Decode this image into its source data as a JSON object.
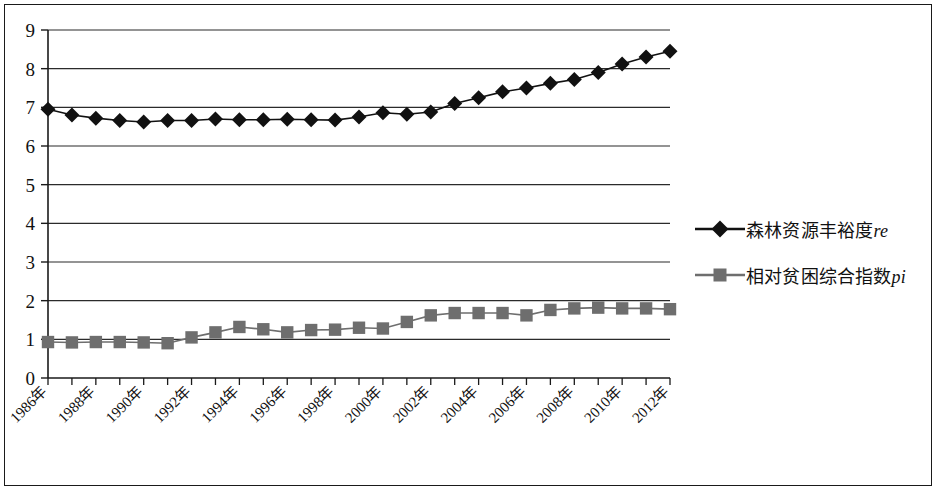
{
  "chart_data": {
    "type": "line",
    "title": "",
    "xlabel": "",
    "ylabel": "",
    "ylim": [
      0,
      9
    ],
    "ytick_step": 1,
    "yticks": [
      "0",
      "1",
      "2",
      "3",
      "4",
      "5",
      "6",
      "7",
      "8",
      "9"
    ],
    "grid": true,
    "grid_axis": "y",
    "legend_position": "right",
    "x": [
      1986,
      1987,
      1988,
      1989,
      1990,
      1991,
      1992,
      1993,
      1994,
      1995,
      1996,
      1997,
      1998,
      1999,
      2000,
      2001,
      2002,
      2003,
      2004,
      2005,
      2006,
      2007,
      2008,
      2009,
      2010,
      2011,
      2012
    ],
    "categories": [
      "1986年",
      "1987年",
      "1988年",
      "1989年",
      "1990年",
      "1991年",
      "1992年",
      "1993年",
      "1994年",
      "1995年",
      "1996年",
      "1997年",
      "1998年",
      "1999年",
      "2000年",
      "2001年",
      "2002年",
      "2003年",
      "2004年",
      "2005年",
      "2006年",
      "2007年",
      "2008年",
      "2009年",
      "2010年",
      "2011年",
      "2012年"
    ],
    "xtick_labels_shown": [
      "1986年",
      "1988年",
      "1990年",
      "1992年",
      "1994年",
      "1996年",
      "1998年",
      "2000年",
      "2002年",
      "2004年",
      "2006年",
      "2008年",
      "2010年",
      "2012年"
    ],
    "series": [
      {
        "name": "森林资源丰裕度re",
        "marker": "diamond",
        "color": "#111111",
        "values": [
          6.95,
          6.8,
          6.72,
          6.66,
          6.62,
          6.66,
          6.66,
          6.7,
          6.68,
          6.68,
          6.69,
          6.68,
          6.67,
          6.75,
          6.86,
          6.82,
          6.88,
          7.1,
          7.25,
          7.4,
          7.5,
          7.62,
          7.72,
          7.9,
          8.12,
          8.3,
          8.45
        ]
      },
      {
        "name": "相对贫困综合指数pi",
        "marker": "square",
        "color": "#6e6e6e",
        "values": [
          0.93,
          0.92,
          0.93,
          0.93,
          0.92,
          0.9,
          1.05,
          1.18,
          1.32,
          1.26,
          1.18,
          1.24,
          1.25,
          1.3,
          1.28,
          1.45,
          1.62,
          1.68,
          1.68,
          1.68,
          1.62,
          1.76,
          1.8,
          1.82,
          1.8,
          1.8,
          1.78
        ]
      }
    ]
  },
  "legend": {
    "items": [
      {
        "label_main": "森林资源丰裕度",
        "label_italic": "re",
        "marker": "diamond-marker",
        "color": "#111111"
      },
      {
        "label_main": "相对贫困综合指数",
        "label_italic": "pi",
        "marker": "square-marker",
        "color": "#6e6e6e"
      }
    ]
  }
}
